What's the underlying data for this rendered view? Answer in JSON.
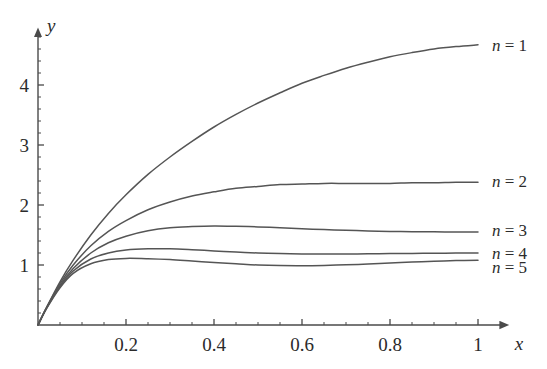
{
  "chart_data": {
    "type": "line",
    "title": "",
    "xlabel": "x",
    "ylabel": "y",
    "xlim": [
      0,
      1.07
    ],
    "ylim": [
      0,
      4.95
    ],
    "grid": false,
    "legend_position": "right-inline",
    "x_ticks": [
      0.2,
      0.4,
      0.6,
      0.8,
      1
    ],
    "x_tick_labels": [
      "0.2",
      "0.4",
      "0.6",
      "0.8",
      "1"
    ],
    "x_minor_tick_step": 0.05,
    "y_ticks": [
      1,
      2,
      3,
      4
    ],
    "y_tick_labels": [
      "1",
      "2",
      "3",
      "4"
    ],
    "y_minor_tick_step": 0.2,
    "line_color": "#555555",
    "axis_color": "#4a4a4a",
    "series": [
      {
        "name": "n = 1",
        "label_value": "1",
        "label_y": 4.67,
        "end_value": 4.67,
        "x": [
          0,
          0.02,
          0.05,
          0.08,
          0.12,
          0.16,
          0.2,
          0.25,
          0.3,
          0.35,
          0.4,
          0.45,
          0.5,
          0.55,
          0.6,
          0.65,
          0.7,
          0.75,
          0.8,
          0.85,
          0.9,
          0.95,
          1
        ],
        "values": [
          0,
          0.3,
          0.72,
          1.08,
          1.5,
          1.86,
          2.17,
          2.51,
          2.8,
          3.06,
          3.3,
          3.51,
          3.7,
          3.87,
          4.03,
          4.16,
          4.28,
          4.38,
          4.47,
          4.54,
          4.6,
          4.64,
          4.67
        ]
      },
      {
        "name": "n = 2",
        "label_value": "2",
        "label_y": 2.4,
        "end_value": 2.38,
        "x": [
          0,
          0.02,
          0.05,
          0.08,
          0.12,
          0.16,
          0.2,
          0.25,
          0.3,
          0.35,
          0.4,
          0.45,
          0.5,
          0.55,
          0.6,
          0.65,
          0.7,
          0.75,
          0.8,
          0.85,
          0.9,
          0.95,
          1
        ],
        "values": [
          0,
          0.3,
          0.69,
          1.0,
          1.32,
          1.56,
          1.74,
          1.92,
          2.05,
          2.15,
          2.22,
          2.28,
          2.31,
          2.34,
          2.35,
          2.36,
          2.36,
          2.36,
          2.36,
          2.37,
          2.37,
          2.38,
          2.38
        ]
      },
      {
        "name": "n = 3",
        "label_value": "3",
        "label_y": 1.58,
        "end_value": 1.55,
        "x": [
          0,
          0.02,
          0.05,
          0.08,
          0.12,
          0.16,
          0.2,
          0.25,
          0.3,
          0.35,
          0.4,
          0.45,
          0.5,
          0.55,
          0.6,
          0.65,
          0.7,
          0.75,
          0.8,
          0.85,
          0.9,
          0.95,
          1
        ],
        "values": [
          0,
          0.29,
          0.66,
          0.94,
          1.2,
          1.37,
          1.48,
          1.57,
          1.62,
          1.64,
          1.65,
          1.645,
          1.635,
          1.62,
          1.605,
          1.59,
          1.578,
          1.568,
          1.56,
          1.556,
          1.553,
          1.551,
          1.55
        ]
      },
      {
        "name": "n = 4",
        "label_value": "4",
        "label_y": 1.2,
        "end_value": 1.2,
        "x": [
          0,
          0.02,
          0.05,
          0.08,
          0.12,
          0.16,
          0.2,
          0.25,
          0.3,
          0.35,
          0.4,
          0.45,
          0.5,
          0.55,
          0.6,
          0.65,
          0.7,
          0.75,
          0.8,
          0.85,
          0.9,
          0.95,
          1
        ],
        "values": [
          0,
          0.29,
          0.64,
          0.9,
          1.1,
          1.2,
          1.25,
          1.27,
          1.27,
          1.255,
          1.235,
          1.215,
          1.2,
          1.19,
          1.185,
          1.183,
          1.184,
          1.186,
          1.19,
          1.193,
          1.196,
          1.198,
          1.2
        ]
      },
      {
        "name": "n = 5",
        "label_value": "5",
        "label_y": 0.97,
        "end_value": 1.08,
        "x": [
          0,
          0.02,
          0.05,
          0.08,
          0.12,
          0.16,
          0.2,
          0.25,
          0.3,
          0.35,
          0.4,
          0.45,
          0.5,
          0.55,
          0.6,
          0.65,
          0.7,
          0.75,
          0.8,
          0.85,
          0.9,
          0.95,
          1
        ],
        "values": [
          0,
          0.28,
          0.62,
          0.86,
          1.02,
          1.09,
          1.11,
          1.105,
          1.09,
          1.065,
          1.04,
          1.02,
          1.0,
          0.99,
          0.988,
          0.993,
          1.003,
          1.017,
          1.033,
          1.049,
          1.063,
          1.073,
          1.08
        ]
      }
    ]
  },
  "axes": {
    "y_name": "y",
    "x_name": "x"
  },
  "legend_prefix": "n ="
}
